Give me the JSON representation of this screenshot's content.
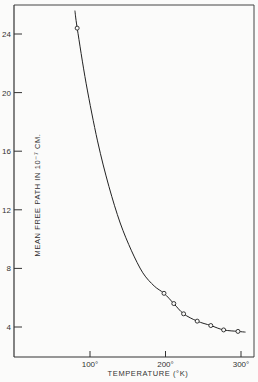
{
  "chart_data": {
    "type": "line",
    "title": "",
    "xlabel": "TEMPERATURE (°K)",
    "ylabel": "MEAN FREE PATH IN 10⁻⁷ CM.",
    "xlim": [
      0,
      315
    ],
    "ylim": [
      2.1,
      26
    ],
    "x_ticks": [
      100,
      200,
      300
    ],
    "x_tick_labels": [
      "100°",
      "200°",
      "300°"
    ],
    "y_ticks": [
      4,
      8,
      12,
      16,
      20,
      24
    ],
    "y_tick_labels": [
      "4",
      "8",
      "12",
      "16",
      "20",
      "24"
    ],
    "grid": false,
    "legend": null,
    "series": [
      {
        "name": "measured",
        "marker": "open-circle",
        "x": [
          83,
          198,
          211,
          224,
          242,
          260,
          277,
          296
        ],
        "values": [
          24.4,
          6.3,
          5.6,
          4.9,
          4.4,
          4.1,
          3.8,
          3.7
        ]
      },
      {
        "name": "fitted-curve",
        "marker": "none",
        "x": [
          80,
          83,
          95,
          110,
          125,
          140,
          155,
          170,
          185,
          198,
          211,
          224,
          242,
          260,
          277,
          296,
          306
        ],
        "values": [
          25.6,
          24.4,
          20.6,
          16.7,
          13.6,
          11.1,
          9.2,
          7.7,
          6.8,
          6.3,
          5.6,
          4.9,
          4.4,
          4.1,
          3.8,
          3.7,
          3.65
        ]
      }
    ]
  }
}
